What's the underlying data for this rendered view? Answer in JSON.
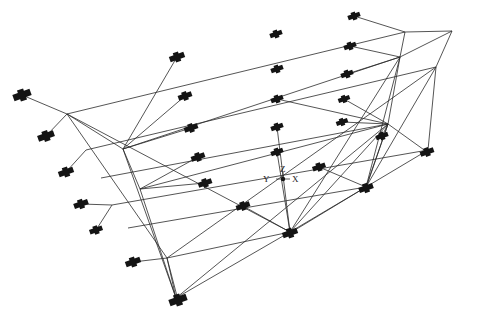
{
  "diagram": {
    "type": "isometric-wireframe-structure",
    "colors": {
      "background": "#ffffff",
      "line": "#2a2a2a",
      "marker": "#141414"
    },
    "axes": {
      "origin": [
        283,
        179
      ],
      "labels": {
        "x": "X",
        "y": "Y",
        "z": "Z"
      },
      "x_label_pos": [
        292,
        182
      ],
      "y_label_pos": [
        263,
        182
      ],
      "z_label_pos": [
        280,
        172
      ]
    },
    "nodes": {
      "A1": [
        67,
        114
      ],
      "A2": [
        86,
        150
      ],
      "A3": [
        101,
        178
      ],
      "A4": [
        112,
        205
      ],
      "A5": [
        128,
        228
      ],
      "A6": [
        176,
        298
      ],
      "B1": [
        123,
        149
      ],
      "B2": [
        140,
        189
      ],
      "B3": [
        167,
        258
      ],
      "C1": [
        405,
        32
      ],
      "C2": [
        452,
        31
      ],
      "C3": [
        400,
        57
      ],
      "C4": [
        436,
        67
      ],
      "C5": [
        388,
        124
      ],
      "C6": [
        428,
        150
      ],
      "D1": [
        290,
        232
      ],
      "D2": [
        366,
        187
      ]
    },
    "lines": [
      [
        "A1",
        "C1"
      ],
      [
        "A1",
        "B1"
      ],
      [
        "A1",
        "B3"
      ],
      [
        "A1",
        "D1"
      ],
      [
        "C1",
        "C2"
      ],
      [
        "C2",
        "C4"
      ],
      [
        "C1",
        "C3"
      ],
      [
        "C2",
        "C3"
      ],
      [
        "B1",
        "C3"
      ],
      [
        "B1",
        "A6"
      ],
      [
        "B1",
        "B2"
      ],
      [
        "A2",
        "C4"
      ],
      [
        "A3",
        "C5"
      ],
      [
        "A4",
        "C6"
      ],
      [
        "A5",
        "D2"
      ],
      [
        "A6",
        "D1"
      ],
      [
        "D1",
        "D2"
      ],
      [
        "D2",
        "C6"
      ],
      [
        "C6",
        "C4"
      ],
      [
        "B2",
        "C5"
      ],
      [
        "B3",
        "D1"
      ],
      [
        "C3",
        "C5"
      ],
      [
        "C5",
        "D2"
      ],
      [
        "C4",
        "D2"
      ],
      [
        "C3",
        "D1"
      ],
      [
        "A6",
        "B3"
      ],
      [
        "B2",
        "A6"
      ],
      [
        "A6",
        "C5"
      ],
      [
        "B3",
        "C4"
      ],
      [
        "D1",
        "C5"
      ],
      [
        "D2",
        "C3"
      ]
    ],
    "markers": [
      {
        "id": "m-top-1",
        "x": 22,
        "y": 95,
        "size": 1.3
      },
      {
        "id": "m-top-2",
        "x": 177,
        "y": 57,
        "size": 1.1
      },
      {
        "id": "m-top-3",
        "x": 276,
        "y": 34,
        "size": 0.9
      },
      {
        "id": "m-top-4",
        "x": 354,
        "y": 16,
        "size": 0.9
      },
      {
        "id": "m-left-2",
        "x": 46,
        "y": 136,
        "size": 1.2
      },
      {
        "id": "m-left-3",
        "x": 66,
        "y": 172,
        "size": 1.1
      },
      {
        "id": "m-left-4",
        "x": 81,
        "y": 204,
        "size": 1.05
      },
      {
        "id": "m-left-5",
        "x": 96,
        "y": 230,
        "size": 0.95
      },
      {
        "id": "m-left-6",
        "x": 133,
        "y": 262,
        "size": 1.1
      },
      {
        "id": "m-bottom-corner",
        "x": 178,
        "y": 300,
        "size": 1.3
      },
      {
        "id": "m-mid-1",
        "x": 185,
        "y": 96,
        "size": 1.0
      },
      {
        "id": "m-mid-2",
        "x": 191,
        "y": 128,
        "size": 1.0
      },
      {
        "id": "m-mid-3",
        "x": 198,
        "y": 157,
        "size": 1.0
      },
      {
        "id": "m-mid-4",
        "x": 205,
        "y": 183,
        "size": 1.0
      },
      {
        "id": "m-mid-5",
        "x": 243,
        "y": 206,
        "size": 1.0
      },
      {
        "id": "m-col-1",
        "x": 277,
        "y": 69,
        "size": 0.9
      },
      {
        "id": "m-col-2",
        "x": 277,
        "y": 99,
        "size": 0.9
      },
      {
        "id": "m-col-3",
        "x": 277,
        "y": 127,
        "size": 0.9
      },
      {
        "id": "m-col-4",
        "x": 277,
        "y": 152,
        "size": 0.9
      },
      {
        "id": "m-r-1",
        "x": 350,
        "y": 46,
        "size": 0.9
      },
      {
        "id": "m-r-2",
        "x": 347,
        "y": 74,
        "size": 0.9
      },
      {
        "id": "m-r-3",
        "x": 344,
        "y": 99,
        "size": 0.85
      },
      {
        "id": "m-r-4",
        "x": 342,
        "y": 122,
        "size": 0.85
      },
      {
        "id": "m-r-5",
        "x": 382,
        "y": 136,
        "size": 0.9
      },
      {
        "id": "m-r-6",
        "x": 319,
        "y": 167,
        "size": 0.95
      },
      {
        "id": "m-corner-right",
        "x": 427,
        "y": 152,
        "size": 1.0
      },
      {
        "id": "m-base-right",
        "x": 366,
        "y": 188,
        "size": 1.05
      },
      {
        "id": "m-base-mid",
        "x": 290,
        "y": 233,
        "size": 1.1
      }
    ]
  }
}
